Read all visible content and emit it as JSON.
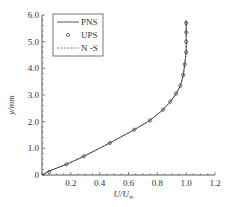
{
  "chart_data": {
    "type": "line",
    "title": "",
    "xlabel": "U/U∞",
    "ylabel": "y/mm",
    "xlim": [
      0,
      1.2
    ],
    "ylim": [
      0,
      6.0
    ],
    "x_ticks": [
      "0.2",
      "0.4",
      "0.6",
      "0.8",
      "1.0",
      "1.2"
    ],
    "y_ticks": [
      "0",
      "1.0",
      "2.0",
      "3.0",
      "4.0",
      "5.0",
      "6.0"
    ],
    "grid": false,
    "legend_position": "top-right",
    "series": [
      {
        "name": "PNS",
        "style": "solid",
        "x": [
          0,
          0.05,
          0.17,
          0.29,
          0.47,
          0.64,
          0.75,
          0.84,
          0.89,
          0.93,
          0.96,
          0.98,
          0.99,
          1.0,
          1.0,
          1.0,
          1.0
        ],
        "y": [
          0,
          0.15,
          0.4,
          0.7,
          1.2,
          1.7,
          2.05,
          2.45,
          2.75,
          3.05,
          3.35,
          3.75,
          4.15,
          4.6,
          5.0,
          5.4,
          5.8
        ]
      },
      {
        "name": "UPS",
        "style": "circle-markers",
        "x": [
          0.05,
          0.17,
          0.29,
          0.47,
          0.64,
          0.75,
          0.84,
          0.89,
          0.93,
          0.96,
          0.98,
          0.99,
          1.0,
          1.0,
          1.0,
          1.0
        ],
        "y": [
          0.12,
          0.4,
          0.7,
          1.2,
          1.7,
          2.05,
          2.45,
          2.75,
          3.05,
          3.35,
          3.75,
          4.15,
          4.6,
          5.0,
          5.35,
          5.7
        ]
      },
      {
        "name": "N-S",
        "style": "dashed",
        "x": [
          0,
          0.05,
          0.17,
          0.29,
          0.47,
          0.64,
          0.75,
          0.84,
          0.89,
          0.93,
          0.96,
          0.98,
          0.99,
          1.0,
          1.0,
          1.0,
          1.0
        ],
        "y": [
          0,
          0.15,
          0.4,
          0.7,
          1.2,
          1.7,
          2.05,
          2.45,
          2.75,
          3.05,
          3.35,
          3.75,
          4.15,
          4.6,
          5.0,
          5.4,
          5.8
        ]
      }
    ]
  },
  "legend": {
    "items": [
      {
        "label": "PNS"
      },
      {
        "label": "UPS"
      },
      {
        "label": "N -S"
      }
    ]
  },
  "axes": {
    "xlabel_main": "U/U",
    "xlabel_sub": "∞",
    "ylabel": "y/mm",
    "origin_label": "0"
  },
  "colors": {
    "line": "#444444",
    "axis": "#555555",
    "text": "#333333"
  }
}
